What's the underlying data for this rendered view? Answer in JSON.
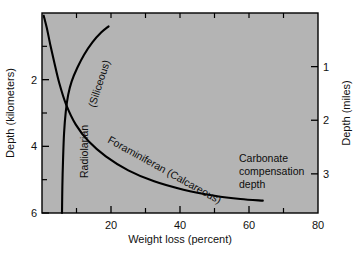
{
  "chart_data": {
    "type": "line",
    "title": "",
    "xlabel": "Weight loss (percent)",
    "ylabel": "Depth (kilometers)",
    "y2label": "Depth (miles)",
    "xlim": [
      0,
      80
    ],
    "ylim": [
      0,
      6
    ],
    "y2lim": [
      0,
      3.73
    ],
    "grid": false,
    "legend": "none",
    "plot_background": "#b4b4b4",
    "line_color": "#000000",
    "axis_color": "#000000",
    "xticks": [
      0,
      20,
      40,
      60,
      80
    ],
    "xticklabels": [
      "",
      "20",
      "40",
      "60",
      "80"
    ],
    "xminorticks": [
      10,
      30,
      50,
      70
    ],
    "yticks": [
      2,
      4,
      6
    ],
    "yticklabels": [
      "2",
      "4",
      "6"
    ],
    "yminorticks": [
      1,
      3,
      5
    ],
    "y2ticks": [
      1,
      2,
      3
    ],
    "y2ticklabels": [
      "1",
      "2",
      "3"
    ],
    "series": [
      {
        "name": "Radiolarian (Siliceous)",
        "label": "Radiolarian",
        "sublabel": "(Siliceous)",
        "points": [
          [
            5.8,
            6.0
          ],
          [
            5.9,
            5.2
          ],
          [
            6.1,
            4.4
          ],
          [
            6.4,
            3.6
          ],
          [
            6.9,
            2.95
          ],
          [
            7.6,
            2.45
          ],
          [
            8.6,
            2.05
          ],
          [
            10.2,
            1.65
          ],
          [
            12.2,
            1.25
          ],
          [
            14.6,
            0.88
          ],
          [
            17.2,
            0.58
          ],
          [
            19.3,
            0.4
          ]
        ]
      },
      {
        "name": "Foraminiferan (Calcareous)",
        "label": "Foraminiferan (Calcareous)",
        "points": [
          [
            0.5,
            0.08
          ],
          [
            1.4,
            0.45
          ],
          [
            2.4,
            0.95
          ],
          [
            3.6,
            1.5
          ],
          [
            5.0,
            2.1
          ],
          [
            7.0,
            2.75
          ],
          [
            9.8,
            3.35
          ],
          [
            13.5,
            3.85
          ],
          [
            18.5,
            4.3
          ],
          [
            25.0,
            4.72
          ],
          [
            32.5,
            5.05
          ],
          [
            41.0,
            5.3
          ],
          [
            50.0,
            5.48
          ],
          [
            57.5,
            5.58
          ],
          [
            64.0,
            5.63
          ]
        ]
      }
    ],
    "annotations": [
      {
        "name": "carbonate-compensation-depth",
        "lines": [
          "Carbonate",
          "compensation",
          "depth"
        ],
        "x": 63.0,
        "y": 4.55
      }
    ]
  }
}
